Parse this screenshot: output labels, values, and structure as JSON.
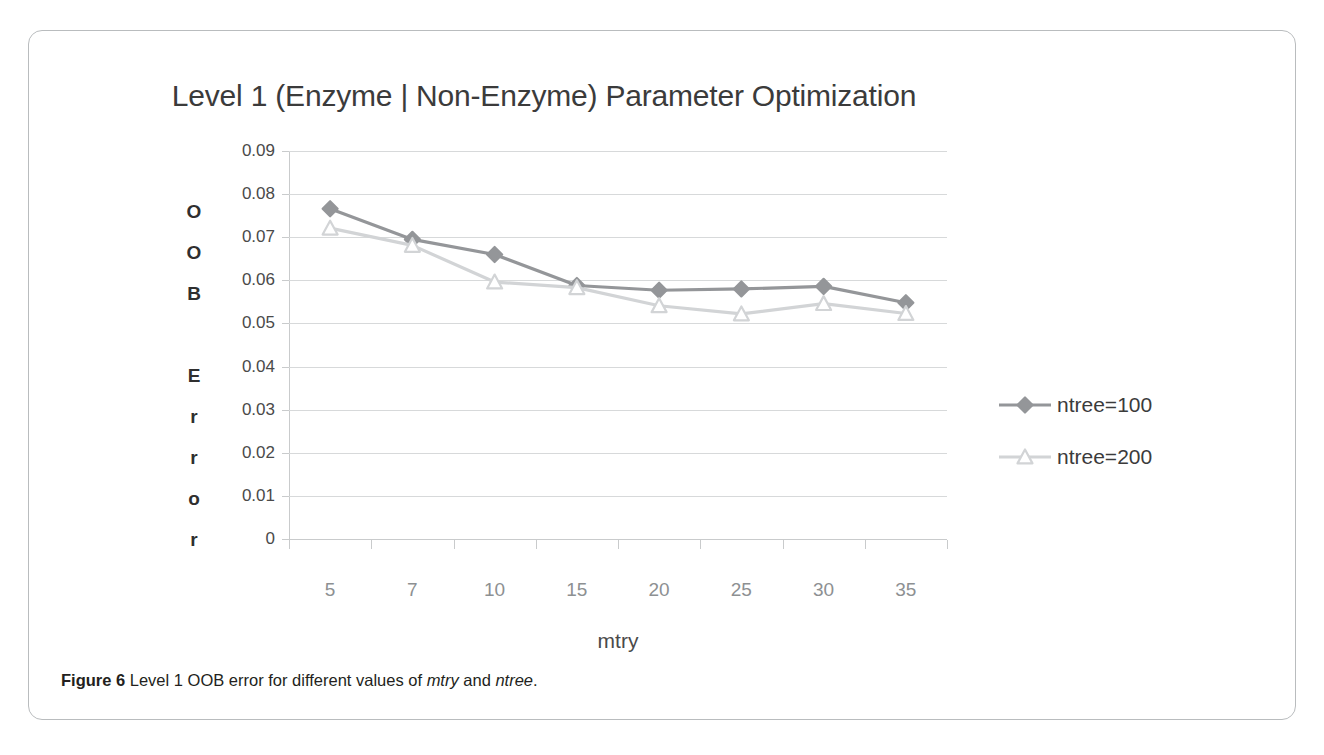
{
  "figure": {
    "caption_label": "Figure 6",
    "caption_text_1": " Level 1 OOB error for different values of ",
    "caption_em_1": "mtry",
    "caption_text_2": " and ",
    "caption_em_2": "ntree",
    "caption_text_3": "."
  },
  "chart_data": {
    "type": "line",
    "title": "Level 1 (Enzyme | Non-Enzyme) Parameter Optimization",
    "xlabel": "mtry",
    "ylabel": "OOB Error",
    "ylabel_letters": [
      "O",
      "O",
      "B",
      " ",
      "E",
      "r",
      "r",
      "o",
      "r"
    ],
    "categories": [
      "5",
      "7",
      "10",
      "15",
      "20",
      "25",
      "30",
      "35"
    ],
    "ytick_labels": [
      "0.09",
      "0.08",
      "0.07",
      "0.06",
      "0.05",
      "0.04",
      "0.03",
      "0.02",
      "0.01",
      "0"
    ],
    "ytick_values": [
      0.09,
      0.08,
      0.07,
      0.06,
      0.05,
      0.04,
      0.03,
      0.02,
      0.01,
      0
    ],
    "ylim": [
      0,
      0.09
    ],
    "grid": true,
    "legend_position": "right",
    "series": [
      {
        "name": "ntree=100",
        "color": "#949699",
        "marker": "diamond",
        "values": [
          0.0766,
          0.0695,
          0.066,
          0.0588,
          0.0577,
          0.058,
          0.0586,
          0.0548
        ]
      },
      {
        "name": "ntree=200",
        "color": "#d2d4d6",
        "marker": "triangle",
        "values": [
          0.0721,
          0.0681,
          0.0596,
          0.0583,
          0.0541,
          0.0522,
          0.0546,
          0.0523
        ]
      }
    ]
  },
  "colors": {
    "frame_border": "#b9bcbe",
    "gridline": "#d7d9da",
    "axis": "#c9cbcc",
    "title_text": "#3b3b3b",
    "tick_text": "#8d9092",
    "series_1": "#949699",
    "series_2": "#d2d4d6",
    "background": "#ffffff"
  }
}
